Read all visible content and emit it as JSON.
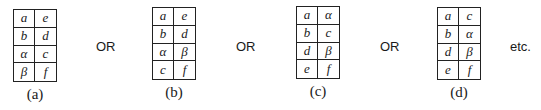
{
  "figures": [
    {
      "label": "(a)",
      "cells": [
        "a",
        "e",
        "b",
        "d",
        "α",
        "c",
        "β",
        "f"
      ]
    },
    {
      "label": "(b)",
      "cells": [
        "a",
        "e",
        "b",
        "d",
        "α",
        "β",
        "c",
        "f"
      ]
    },
    {
      "label": "(c)",
      "cells": [
        "a",
        "α",
        "b",
        "c",
        "d",
        "β",
        "e",
        "f"
      ]
    },
    {
      "label": "(d)",
      "cells": [
        "a",
        "c",
        "b",
        "α",
        "d",
        "β",
        "e",
        "f"
      ]
    }
  ],
  "separators": [
    "OR",
    "OR",
    "OR"
  ],
  "trailing": "etc."
}
